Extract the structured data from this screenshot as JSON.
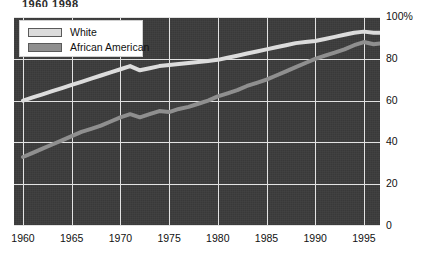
{
  "title_fragment": "1960  1998",
  "legend": {
    "position": "top-left-inside-plot",
    "items": [
      {
        "label": "White",
        "color": "#dcdcdc"
      },
      {
        "label": "African American",
        "color": "#8f8f8f"
      }
    ]
  },
  "axes": {
    "y_ticks": [
      "100%",
      "80",
      "60",
      "40",
      "20",
      "0"
    ],
    "y_tick_values": [
      100,
      80,
      60,
      40,
      20,
      0
    ],
    "x_ticks": [
      "1960",
      "1965",
      "1970",
      "1975",
      "1980",
      "1985",
      "1990",
      "1995"
    ],
    "x_tick_values": [
      1960,
      1965,
      1970,
      1975,
      1980,
      1985,
      1990,
      1995
    ]
  },
  "colors": {
    "plot_background": "#3c3c3c",
    "gridline": "#e2e2e2",
    "white_series": "#dcdcdc",
    "african_american_series": "#8f8f8f",
    "page_background": "#ffffff",
    "text": "#111111"
  },
  "chart_data": {
    "type": "line",
    "title": "1960  1998",
    "xlabel": "",
    "ylabel": "",
    "xlim": [
      1960,
      1998
    ],
    "ylim": [
      0,
      100
    ],
    "grid": true,
    "legend_position": "upper left",
    "x": [
      1960,
      1961,
      1962,
      1963,
      1964,
      1965,
      1966,
      1967,
      1968,
      1969,
      1970,
      1971,
      1972,
      1973,
      1974,
      1975,
      1976,
      1977,
      1978,
      1979,
      1980,
      1981,
      1982,
      1983,
      1984,
      1985,
      1986,
      1987,
      1988,
      1989,
      1990,
      1991,
      1992,
      1993,
      1994,
      1995,
      1996,
      1997,
      1998
    ],
    "series": [
      {
        "name": "White",
        "color": "#dcdcdc",
        "values": [
          60,
          61.5,
          63,
          64.5,
          66,
          67.5,
          69,
          70.5,
          72,
          73.5,
          75,
          76.5,
          74.5,
          75.5,
          76.5,
          77,
          77.5,
          78,
          78.5,
          79,
          79.5,
          80.5,
          81.5,
          82.5,
          83.5,
          84.5,
          85.5,
          86.5,
          87.5,
          88,
          88.5,
          89.5,
          90.5,
          91.5,
          92.5,
          93,
          92.5,
          92.5,
          92.5
        ]
      },
      {
        "name": "African American",
        "color": "#8f8f8f",
        "values": [
          33,
          35,
          37,
          39,
          41,
          43,
          45,
          46.5,
          48,
          50,
          52,
          53.5,
          52,
          53.5,
          55,
          54.5,
          56,
          57,
          58.5,
          60,
          62,
          63.5,
          65,
          67,
          68.5,
          70,
          72,
          74,
          76,
          78,
          80,
          81.5,
          83,
          84.5,
          86.5,
          88,
          87,
          87.5,
          87.5
        ]
      }
    ]
  }
}
